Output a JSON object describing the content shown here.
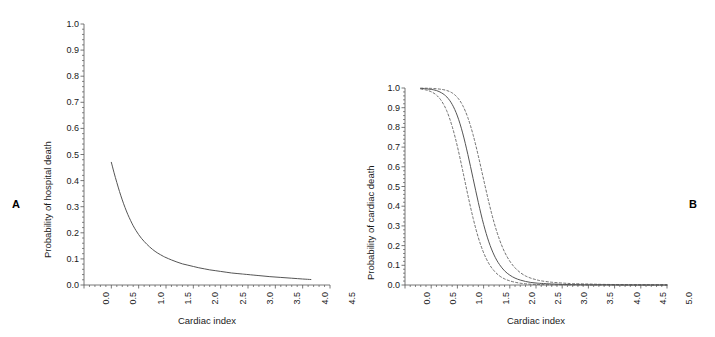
{
  "figure": {
    "background_color": "#ffffff",
    "line_color": "#555555",
    "text_color": "#1a1a1a",
    "panels": [
      {
        "letter": "A",
        "name": "panel-a"
      },
      {
        "letter": "B",
        "name": "panel-b"
      }
    ]
  },
  "chart_data": [
    {
      "type": "line",
      "panel": "A",
      "title": "",
      "xlabel": "Cardiac index",
      "ylabel": "Probability of hospital death",
      "xlim": [
        0.0,
        4.5
      ],
      "ylim": [
        0.0,
        1.0
      ],
      "xticks": [
        "0.0",
        "0.5",
        "1.0",
        "1.5",
        "2.0",
        "2.5",
        "3.0",
        "3.5",
        "4.0",
        "4.5"
      ],
      "xtick_values": [
        0.0,
        0.5,
        1.0,
        1.5,
        2.0,
        2.5,
        3.0,
        3.5,
        4.0,
        4.5
      ],
      "yticks": [
        "0.0",
        "0.1",
        "0.2",
        "0.3",
        "0.4",
        "0.5",
        "0.6",
        "0.7",
        "0.8",
        "0.9",
        "1.0"
      ],
      "ytick_values": [
        0.0,
        0.1,
        0.2,
        0.3,
        0.4,
        0.5,
        0.6,
        0.7,
        0.8,
        0.9,
        1.0
      ],
      "grid": false,
      "legend": "none",
      "minor_ticks": true,
      "series": [
        {
          "name": "Probability of hospital death",
          "style": "solid",
          "x": [
            0.5,
            0.55,
            0.6,
            0.65,
            0.7,
            0.75,
            0.8,
            0.85,
            0.9,
            0.95,
            1.0,
            1.05,
            1.1,
            1.15,
            1.2,
            1.25,
            1.3,
            1.35,
            1.4,
            1.45,
            1.5,
            1.6,
            1.7,
            1.8,
            1.9,
            2.0,
            2.1,
            2.2,
            2.3,
            2.4,
            2.5,
            2.6,
            2.7,
            2.8,
            2.9,
            3.0,
            3.2,
            3.4,
            3.6,
            3.8,
            4.0,
            4.15
          ],
          "y": [
            0.47,
            0.43,
            0.393,
            0.358,
            0.326,
            0.297,
            0.271,
            0.248,
            0.227,
            0.209,
            0.193,
            0.179,
            0.167,
            0.156,
            0.146,
            0.137,
            0.129,
            0.122,
            0.116,
            0.11,
            0.105,
            0.096,
            0.088,
            0.081,
            0.076,
            0.071,
            0.066,
            0.062,
            0.058,
            0.055,
            0.052,
            0.049,
            0.046,
            0.044,
            0.042,
            0.04,
            0.036,
            0.032,
            0.029,
            0.026,
            0.023,
            0.021
          ]
        }
      ]
    },
    {
      "type": "line",
      "panel": "B",
      "title": "",
      "xlabel": "Cardiac index",
      "ylabel": "Probability of cardiac death",
      "xlim": [
        0.0,
        5.0
      ],
      "ylim": [
        0.0,
        1.0
      ],
      "xticks": [
        "0.0",
        "0.5",
        "1.0",
        "1.5",
        "2.0",
        "2.5",
        "3.0",
        "3.5",
        "4.0",
        "4.5",
        "5.0"
      ],
      "xtick_values": [
        0.0,
        0.5,
        1.0,
        1.5,
        2.0,
        2.5,
        3.0,
        3.5,
        4.0,
        4.5,
        5.0
      ],
      "yticks": [
        "0.0",
        "0.1",
        "0.2",
        "0.3",
        "0.4",
        "0.5",
        "0.6",
        "0.7",
        "0.8",
        "0.9",
        "1.0"
      ],
      "ytick_values": [
        0.0,
        0.1,
        0.2,
        0.3,
        0.4,
        0.5,
        0.6,
        0.7,
        0.8,
        0.9,
        1.0
      ],
      "grid": false,
      "legend": "none",
      "minor_ticks": true,
      "series": [
        {
          "name": "Probability of cardiac death",
          "style": "solid",
          "x": [
            0.3,
            0.4,
            0.5,
            0.6,
            0.7,
            0.8,
            0.9,
            1.0,
            1.1,
            1.2,
            1.3,
            1.4,
            1.5,
            1.6,
            1.7,
            1.8,
            1.9,
            2.0,
            2.1,
            2.2,
            2.3,
            2.4,
            2.5,
            2.6,
            2.8,
            3.0,
            3.2,
            3.5,
            3.8,
            4.2,
            4.6,
            5.0
          ],
          "y": [
            0.998,
            0.996,
            0.993,
            0.987,
            0.975,
            0.954,
            0.917,
            0.858,
            0.772,
            0.662,
            0.54,
            0.418,
            0.308,
            0.219,
            0.152,
            0.105,
            0.072,
            0.05,
            0.035,
            0.025,
            0.018,
            0.013,
            0.01,
            0.008,
            0.005,
            0.003,
            0.002,
            0.001,
            0.001,
            0.0,
            0.0,
            0.0
          ]
        },
        {
          "name": "Upper 95% confidence limit",
          "style": "dashed",
          "x": [
            0.3,
            0.4,
            0.5,
            0.6,
            0.7,
            0.8,
            0.9,
            1.0,
            1.1,
            1.2,
            1.3,
            1.4,
            1.5,
            1.6,
            1.7,
            1.8,
            1.9,
            2.0,
            2.1,
            2.2,
            2.3,
            2.4,
            2.5,
            2.6,
            2.8,
            3.0,
            3.2,
            3.5,
            3.8,
            4.2,
            4.6,
            5.0
          ],
          "y": [
            0.999,
            0.999,
            0.998,
            0.996,
            0.993,
            0.987,
            0.975,
            0.952,
            0.912,
            0.849,
            0.762,
            0.654,
            0.536,
            0.42,
            0.317,
            0.233,
            0.168,
            0.121,
            0.087,
            0.063,
            0.046,
            0.035,
            0.027,
            0.021,
            0.014,
            0.01,
            0.007,
            0.005,
            0.003,
            0.002,
            0.001,
            0.001
          ]
        },
        {
          "name": "Lower 95% confidence limit",
          "style": "dashed",
          "x": [
            0.3,
            0.4,
            0.5,
            0.6,
            0.7,
            0.8,
            0.9,
            1.0,
            1.1,
            1.2,
            1.3,
            1.4,
            1.5,
            1.6,
            1.7,
            1.8,
            1.9,
            2.0,
            2.1,
            2.2,
            2.3,
            2.4,
            2.5,
            2.6,
            2.8,
            3.0,
            3.2,
            3.5,
            3.8,
            4.2,
            4.6,
            5.0
          ],
          "y": [
            0.995,
            0.99,
            0.981,
            0.964,
            0.933,
            0.882,
            0.805,
            0.703,
            0.582,
            0.456,
            0.339,
            0.24,
            0.164,
            0.109,
            0.072,
            0.047,
            0.031,
            0.021,
            0.014,
            0.009,
            0.006,
            0.004,
            0.003,
            0.002,
            0.001,
            0.001,
            0.0,
            0.0,
            0.0,
            0.0,
            0.0,
            0.0
          ]
        }
      ]
    }
  ]
}
